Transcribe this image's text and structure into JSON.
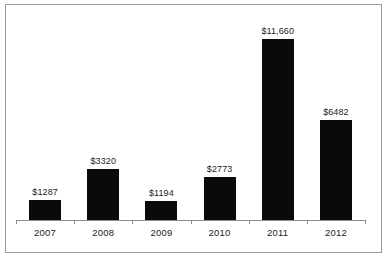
{
  "chart_data": {
    "type": "bar",
    "title": "",
    "subtitle": "",
    "xlabel": "",
    "ylabel": "",
    "categories": [
      "2007",
      "2008",
      "2009",
      "2010",
      "2011",
      "2012"
    ],
    "values": [
      1287,
      3320,
      1194,
      2773,
      11660,
      6482
    ],
    "value_labels": [
      "$1287",
      "$3320",
      "$1194",
      "$2773",
      "$11,660",
      "$6482"
    ],
    "series": [
      {
        "name": "",
        "values": [
          1287,
          3320,
          1194,
          2773,
          11660,
          6482
        ]
      }
    ],
    "ylim": [
      0,
      12000
    ],
    "grid": false,
    "legend": false,
    "legend_position": "none",
    "bar_color": "#0a0a0a",
    "axis_color": "#8e8e8e",
    "frame_color": "#9a9a9a",
    "label_color": "#1c1c1c",
    "background": "#ffffff",
    "annotations": []
  }
}
